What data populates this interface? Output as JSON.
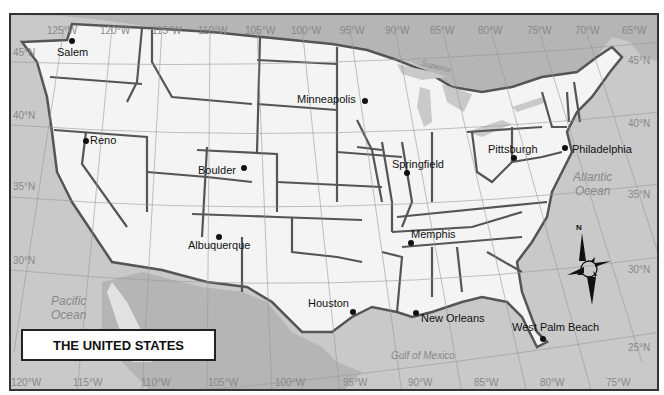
{
  "title": "THE UNITED STATES",
  "colors": {
    "land_us": "#f4f4f4",
    "land_other": "#e2e2e2",
    "water": "#c9c9c9",
    "canada_mexico": "#b5b5b5",
    "border": "#555555",
    "grid": "#999999"
  },
  "cities": [
    {
      "name": "Salem",
      "dot": [
        70,
        40
      ],
      "label": [
        57,
        45
      ]
    },
    {
      "name": "Minneapolis",
      "dot": [
        363,
        100
      ],
      "label": [
        297,
        93
      ]
    },
    {
      "name": "Reno",
      "dot": [
        84,
        140
      ],
      "label": [
        90,
        134
      ]
    },
    {
      "name": "Boulder",
      "dot": [
        242,
        167
      ],
      "label": [
        198,
        163
      ]
    },
    {
      "name": "Springfield",
      "dot": [
        405,
        172
      ],
      "label": [
        393,
        158
      ]
    },
    {
      "name": "Pittsburgh",
      "dot": [
        512,
        157
      ],
      "label": [
        488,
        143
      ]
    },
    {
      "name": "Philadelphia",
      "dot": [
        563,
        147
      ],
      "label": [
        572,
        143
      ]
    },
    {
      "name": "Albuquerque",
      "dot": [
        217,
        236
      ],
      "label": [
        188,
        239
      ]
    },
    {
      "name": "Memphis",
      "dot": [
        409,
        242
      ],
      "label": [
        411,
        228
      ]
    },
    {
      "name": "Houston",
      "dot": [
        351,
        311
      ],
      "label": [
        308,
        297
      ]
    },
    {
      "name": "New Orleans",
      "dot": [
        414,
        312
      ],
      "label": [
        421,
        311
      ]
    },
    {
      "name": "West Palm Beach",
      "dot": [
        541,
        338
      ],
      "label": [
        512,
        321
      ]
    }
  ],
  "water_labels": [
    {
      "name": "Pacific Ocean",
      "lines": [
        "Pacific",
        "Ocean"
      ],
      "pos": [
        50,
        292
      ]
    },
    {
      "name": "Atlantic Ocean",
      "lines": [
        "Atlantic",
        "Ocean"
      ],
      "pos": [
        580,
        170
      ]
    },
    {
      "name": "Gulf of Mexico",
      "lines": [
        "Gulf of Mexico"
      ],
      "pos": [
        388,
        346
      ]
    }
  ],
  "lake_labels": [
    "Superior",
    "Michigan",
    "Huron",
    "Erie",
    "Ontario"
  ],
  "longitude_top": [
    {
      "label": "125°W",
      "x": 45
    },
    {
      "label": "120°W",
      "x": 98
    },
    {
      "label": "115°W",
      "x": 150
    },
    {
      "label": "110°W",
      "x": 196
    },
    {
      "label": "105°W",
      "x": 243
    },
    {
      "label": "100°W",
      "x": 289
    },
    {
      "label": "95°W",
      "x": 338
    },
    {
      "label": "90°W",
      "x": 383
    },
    {
      "label": "85°W",
      "x": 428
    },
    {
      "label": "80°W",
      "x": 476
    },
    {
      "label": "75°W",
      "x": 525
    },
    {
      "label": "70°W",
      "x": 573
    },
    {
      "label": "65°W",
      "x": 620
    }
  ],
  "longitude_bottom": [
    {
      "label": "120°W",
      "x": 2
    },
    {
      "label": "115°W",
      "x": 64
    },
    {
      "label": "110°W",
      "x": 132
    },
    {
      "label": "105°W",
      "x": 199
    },
    {
      "label": "100°W",
      "x": 266
    },
    {
      "label": "95°W",
      "x": 334
    },
    {
      "label": "90°W",
      "x": 399
    },
    {
      "label": "85°W",
      "x": 465
    },
    {
      "label": "80°W",
      "x": 531
    },
    {
      "label": "75°W",
      "x": 597
    }
  ],
  "latitude_left": [
    {
      "label": "45°N",
      "y": 46
    },
    {
      "label": "40°N",
      "y": 109
    },
    {
      "label": "35°N",
      "y": 180
    },
    {
      "label": "30°N",
      "y": 254
    }
  ],
  "latitude_right": [
    {
      "label": "45°N",
      "y": 40
    },
    {
      "label": "40°N",
      "y": 108
    },
    {
      "label": "35°N",
      "y": 180
    },
    {
      "label": "30°N",
      "y": 253
    },
    {
      "label": "25°N",
      "y": 331
    }
  ],
  "compass": {
    "label": "N"
  }
}
